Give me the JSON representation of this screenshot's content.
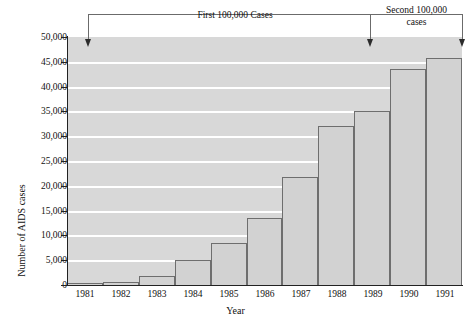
{
  "chart_data": {
    "type": "bar",
    "title": "",
    "xlabel": "Year",
    "ylabel": "Number of AIDS cases",
    "categories": [
      "1981",
      "1982",
      "1983",
      "1984",
      "1985",
      "1986",
      "1987",
      "1988",
      "1989",
      "1990",
      "1991"
    ],
    "values": [
      250,
      700,
      1900,
      5000,
      8400,
      13600,
      21800,
      32000,
      35000,
      43500,
      45800
    ],
    "ylim": [
      0,
      50000
    ],
    "ytick_values": [
      0,
      5000,
      10000,
      15000,
      20000,
      25000,
      30000,
      35000,
      40000,
      45000,
      50000
    ],
    "ytick_labels": [
      "0",
      "5,000",
      "10,000",
      "15,000",
      "20,000",
      "25,000",
      "30,000",
      "35,000",
      "40,000",
      "45,000",
      "50,000"
    ],
    "grid": true,
    "legend": "none",
    "annotations": [
      {
        "id": "first-span",
        "text": "First 100,000 Cases",
        "from_category": "1981",
        "to_category": "1989"
      },
      {
        "id": "second-span",
        "text_line1": "Second 100,000",
        "text_line2": "cases",
        "from_category": "1989",
        "to_category": "1991"
      }
    ],
    "colors": {
      "bar_fill": "#d2d2d2",
      "bar_stroke": "#6e6e6e",
      "plot_background": "#d8d8d8",
      "gridline": "#ffffff",
      "axis": "#222222",
      "annotation": "#6b6b6b",
      "text": "#111111"
    }
  }
}
